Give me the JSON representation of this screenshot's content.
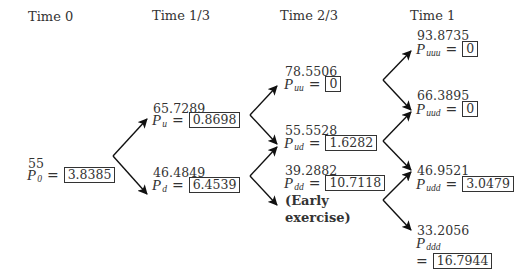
{
  "headers": [
    "Time 0",
    "Time 1/3",
    "Time 2/3",
    "Time 1"
  ],
  "nodes": {
    "n0": {
      "price": "55",
      "label": "P",
      "sub": "0",
      "eq": "=",
      "value": "3.8385"
    },
    "u": {
      "price": "65.7289",
      "label": "P",
      "sub": "u",
      "eq": "=",
      "value": "0.8698"
    },
    "d": {
      "price": "46.4849",
      "label": "P",
      "sub": "d",
      "eq": "=",
      "value": "6.4539"
    },
    "uu": {
      "price": "78.5506",
      "label": "P",
      "sub": "uu",
      "eq": "=",
      "value": "0"
    },
    "ud": {
      "price": "55.5528",
      "label": "P",
      "sub": "ud",
      "eq": "=",
      "value": "1.6282"
    },
    "dd": {
      "price": "39.2882",
      "label": "P",
      "sub": "dd",
      "eq": "=",
      "value": "10.7118",
      "note_line1": "(Early",
      "note_line2": "exercise)"
    },
    "uuu": {
      "price": "93.8735",
      "label": "P",
      "sub": "uuu",
      "eq": "=",
      "value": "0"
    },
    "uud": {
      "price": "66.3895",
      "label": "P",
      "sub": "uud",
      "eq": "=",
      "value": "0"
    },
    "udd": {
      "price": "46.9521",
      "label": "P",
      "sub": "udd",
      "eq": "=",
      "value": "3.0479"
    },
    "ddd": {
      "price": "33.2056",
      "label": "P",
      "sub": "ddd",
      "eq": "=",
      "value": "16.7944"
    }
  },
  "colors": {
    "line": "#111111",
    "text": "#333333",
    "box_border": "#333333"
  }
}
